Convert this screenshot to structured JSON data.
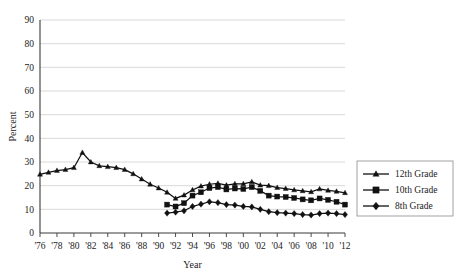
{
  "chart_data": {
    "type": "line",
    "title": "",
    "xlabel": "Year",
    "ylabel": "Percent",
    "ylim": [
      0,
      90
    ],
    "xlim": [
      1976,
      2012
    ],
    "grid": true,
    "legend_position": "right",
    "y_ticks": [
      "0",
      "10",
      "20",
      "30",
      "40",
      "50",
      "60",
      "70",
      "80",
      "90"
    ],
    "x_ticks": [
      "'76",
      "'78",
      "'80",
      "'82",
      "'84",
      "'86",
      "'88",
      "'90",
      "'92",
      "'94",
      "'96",
      "'98",
      "'00",
      "'02",
      "'04",
      "'06",
      "'08",
      "'10",
      "'12"
    ],
    "x_tick_years": [
      1976,
      1978,
      1980,
      1982,
      1984,
      1986,
      1988,
      1990,
      1992,
      1994,
      1996,
      1998,
      2000,
      2002,
      2004,
      2006,
      2008,
      2010,
      2012
    ],
    "series": [
      {
        "name": "12th Grade",
        "marker": "triangle",
        "color": "#111111",
        "x": [
          1976,
          1977,
          1978,
          1979,
          1980,
          1981,
          1982,
          1983,
          1984,
          1985,
          1986,
          1987,
          1988,
          1989,
          1990,
          1991,
          1992,
          1993,
          1994,
          1995,
          1996,
          1997,
          1998,
          1999,
          2000,
          2001,
          2002,
          2003,
          2004,
          2005,
          2006,
          2007,
          2008,
          2009,
          2010,
          2011,
          2012
        ],
        "values": [
          24.8,
          25.6,
          26.4,
          26.8,
          27.6,
          34.0,
          30.0,
          28.4,
          28.0,
          27.6,
          26.8,
          25.0,
          22.8,
          20.6,
          19.0,
          17.2,
          14.6,
          16.0,
          18.2,
          19.8,
          20.6,
          21.0,
          20.2,
          20.8,
          20.8,
          21.6,
          20.2,
          20.0,
          19.2,
          18.8,
          18.2,
          17.8,
          17.4,
          18.6,
          18.0,
          17.6,
          17.0
        ]
      },
      {
        "name": "10th Grade",
        "marker": "square",
        "color": "#111111",
        "x": [
          1991,
          1992,
          1993,
          1994,
          1995,
          1996,
          1997,
          1998,
          1999,
          2000,
          2001,
          2002,
          2003,
          2004,
          2005,
          2006,
          2007,
          2008,
          2009,
          2010,
          2011,
          2012
        ],
        "values": [
          12.0,
          11.2,
          12.6,
          15.8,
          17.2,
          19.0,
          19.4,
          18.4,
          18.8,
          18.6,
          19.4,
          17.8,
          15.8,
          15.4,
          15.2,
          14.8,
          14.2,
          13.8,
          14.6,
          14.0,
          13.2,
          12.0
        ]
      },
      {
        "name": "8th Grade",
        "marker": "diamond",
        "color": "#111111",
        "x": [
          1991,
          1992,
          1993,
          1994,
          1995,
          1996,
          1997,
          1998,
          1999,
          2000,
          2001,
          2002,
          2003,
          2004,
          2005,
          2006,
          2007,
          2008,
          2009,
          2010,
          2011,
          2012
        ],
        "values": [
          8.4,
          8.8,
          9.4,
          11.2,
          12.2,
          13.2,
          12.8,
          12.0,
          11.8,
          11.2,
          11.0,
          10.0,
          9.0,
          8.6,
          8.4,
          8.2,
          7.8,
          7.6,
          8.2,
          8.4,
          8.2,
          7.8
        ]
      }
    ]
  },
  "legend": {
    "items": [
      {
        "label": "12th Grade",
        "marker": "triangle"
      },
      {
        "label": "10th Grade",
        "marker": "square"
      },
      {
        "label": "8th Grade",
        "marker": "diamond"
      }
    ]
  }
}
